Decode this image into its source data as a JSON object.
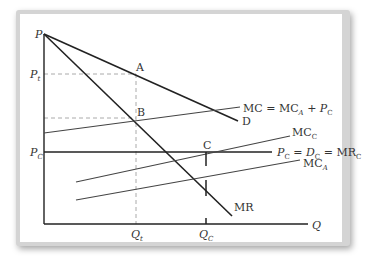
{
  "diagram": {
    "axis_labels": {
      "y": "P",
      "x": "Q"
    },
    "price_labels": {
      "p_t": {
        "main": "P",
        "sub": "t"
      },
      "p_c": {
        "main": "P",
        "sub": "C"
      }
    },
    "quantity_labels": {
      "q_t": {
        "main": "Q",
        "sub": "t"
      },
      "q_c": {
        "main": "Q",
        "sub": "C"
      }
    },
    "points": {
      "a": "A",
      "b": "B",
      "c": "C"
    },
    "curves": {
      "demand": "D",
      "marginal_revenue": "MR",
      "mc_total": {
        "text": "MC = MC",
        "sub_a": "A",
        "plus": " + ",
        "p": "P",
        "sub_c": "C"
      },
      "mc_c": {
        "main": "MC",
        "sub": "C"
      },
      "mc_a": {
        "main": "MC",
        "sub": "A"
      },
      "competitive": {
        "p": "P",
        "sub1": "C",
        "eq1": " = ",
        "d": "D",
        "sub2": "C",
        "eq2": " = MR",
        "sub3": "C"
      }
    },
    "colors": {
      "line": "#222222",
      "dashed": "#aaaaaa",
      "shadow": "#d4d4d4"
    }
  }
}
